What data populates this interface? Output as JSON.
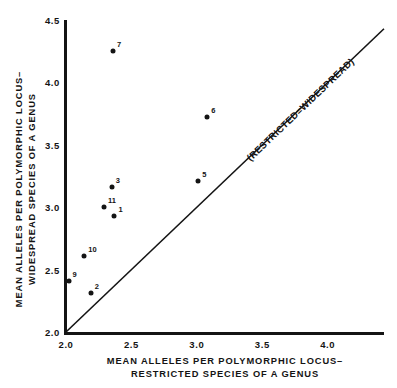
{
  "chart_data": {
    "type": "scatter",
    "title": "",
    "xlabel": "MEAN ALLELES PER POLYMORPHIC LOCUS– RESTRICTED SPECIES OF A GENUS",
    "ylabel": "MEAN ALLELES PER POLYMORPHIC LOCUS– WIDESPREAD SPECIES OF A GENUS",
    "xlabel_line1": "MEAN ALLELES PER POLYMORPHIC LOCUS–",
    "xlabel_line2": "RESTRICTED SPECIES OF A GENUS",
    "ylabel_line1": "MEAN ALLELES PER POLYMORPHIC LOCUS–",
    "ylabel_line2": "WIDESPREAD SPECIES OF A GENUS",
    "xlim": [
      2.0,
      4.43
    ],
    "ylim": [
      2.0,
      4.5
    ],
    "xticks": [
      2.0,
      2.5,
      3.0,
      3.5,
      4.0
    ],
    "yticks": [
      2.0,
      2.5,
      3.0,
      3.5,
      4.0,
      4.5
    ],
    "xtick_labels": [
      "2.0",
      "2.5",
      "3.0",
      "3.5",
      "4.0"
    ],
    "ytick_labels": [
      "2.0",
      "2.5",
      "3.0",
      "3.5",
      "4.0",
      "4.5"
    ],
    "grid": false,
    "legend": null,
    "marker_color": "#141414",
    "axis_color": "#141414",
    "points": [
      {
        "label": "7",
        "x": 2.36,
        "y": 4.25,
        "label_dx": 4,
        "label_dy": -2
      },
      {
        "label": "6",
        "x": 3.08,
        "y": 3.72,
        "label_dx": 4,
        "label_dy": -2
      },
      {
        "label": "5",
        "x": 3.01,
        "y": 3.21,
        "label_dx": 4,
        "label_dy": -2
      },
      {
        "label": "3",
        "x": 2.35,
        "y": 3.16,
        "label_dx": 4,
        "label_dy": -2
      },
      {
        "label": "11",
        "x": 2.29,
        "y": 3.0,
        "label_dx": 4,
        "label_dy": -2
      },
      {
        "label": "1",
        "x": 2.37,
        "y": 2.93,
        "label_dx": 4,
        "label_dy": -2
      },
      {
        "label": "10",
        "x": 2.14,
        "y": 2.61,
        "label_dx": 4,
        "label_dy": -2
      },
      {
        "label": "9",
        "x": 2.02,
        "y": 2.41,
        "label_dx": 4,
        "label_dy": -2
      },
      {
        "label": "2",
        "x": 2.19,
        "y": 2.31,
        "label_dx": 4,
        "label_dy": -2
      }
    ],
    "annotations": [
      {
        "text": "(RESTRICTED=WIDESPREAD)",
        "kind": "identity-line-label",
        "rotation_deg": -45
      }
    ],
    "reference_line": {
      "kind": "identity",
      "from": [
        2.0,
        2.0
      ],
      "to": [
        4.43,
        4.43
      ],
      "color": "#141414"
    }
  }
}
